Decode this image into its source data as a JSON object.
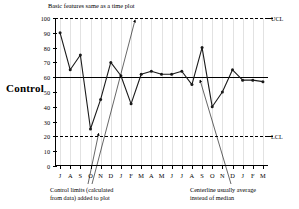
{
  "side_label": "Control",
  "chart_data": {
    "type": "line",
    "title": "Basic features same as a time plot",
    "xlabel": "",
    "ylabel": "",
    "ylim": [
      0,
      100
    ],
    "yticks": [
      0,
      10,
      20,
      30,
      40,
      50,
      60,
      70,
      80,
      90,
      100
    ],
    "grid": "vertical",
    "legend": "none",
    "categories": [
      "J",
      "A",
      "S",
      "O",
      "N",
      "D",
      "J",
      "F",
      "M",
      "A",
      "M",
      "J",
      "J",
      "A",
      "S",
      "O",
      "N",
      "D",
      "J",
      "F",
      "M"
    ],
    "values": [
      90,
      65,
      75,
      25,
      45,
      70,
      61,
      42,
      62,
      64,
      62,
      62,
      64,
      55,
      80,
      40,
      50,
      65,
      58,
      58,
      57
    ],
    "reference_lines": [
      {
        "name": "UCL",
        "label": "UCL",
        "value": 100,
        "style": "dashed"
      },
      {
        "name": "centerline",
        "label": "",
        "value": 60,
        "style": "solid"
      },
      {
        "name": "LCL",
        "label": "LCL",
        "value": 20,
        "style": "dashed"
      }
    ],
    "annotations": [
      {
        "name": "control-limits-note",
        "text": "Control limits (calculated from data) added to plot",
        "points_to": [
          "UCL",
          "LCL"
        ]
      },
      {
        "name": "centerline-note",
        "text": "Centerline usually average instead of median",
        "points_to": [
          "centerline"
        ]
      }
    ],
    "colors": {
      "series": "#1a1a1a",
      "gridline": "#e2e2e2",
      "axis": "#000000",
      "background": "#ffffff"
    }
  },
  "annotations": {
    "left_line1": "Control limits (calculated",
    "left_line2": "from data) added to plot",
    "right_line1": "Centerline usually average",
    "right_line2": "instead of median"
  },
  "limits": {
    "ucl_label": "UCL",
    "lcl_label": "LCL"
  }
}
